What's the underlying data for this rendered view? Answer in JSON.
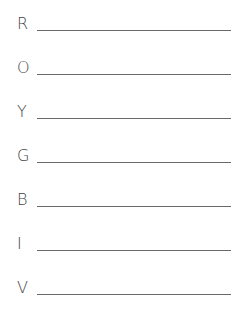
{
  "worksheet": {
    "rows": [
      {
        "letter": "R",
        "answer": ""
      },
      {
        "letter": "O",
        "answer": ""
      },
      {
        "letter": "Y",
        "answer": ""
      },
      {
        "letter": "G",
        "answer": ""
      },
      {
        "letter": "B",
        "answer": ""
      },
      {
        "letter": "I",
        "answer": ""
      },
      {
        "letter": "V",
        "answer": ""
      }
    ]
  }
}
